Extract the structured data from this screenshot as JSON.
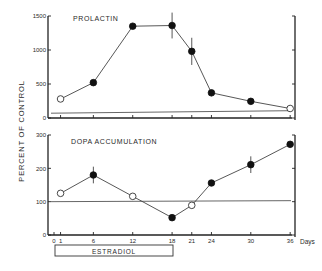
{
  "figure": {
    "y_axis_label": "PERCENT OF CONTROL",
    "x_unit_label": "Days",
    "treatment_bar_label": "ESTRADIOL",
    "treatment_period": [
      0,
      18
    ]
  },
  "chart_data": [
    {
      "type": "line",
      "title": "PROLACTIN",
      "xlabel": "Days",
      "ylabel": "PERCENT OF CONTROL",
      "x": [
        1,
        6,
        12,
        18,
        21,
        24,
        30,
        36
      ],
      "values": [
        280,
        520,
        1350,
        1360,
        980,
        370,
        245,
        140
      ],
      "marker_filled": [
        false,
        true,
        true,
        true,
        true,
        true,
        true,
        false
      ],
      "error_bars": [
        0,
        30,
        40,
        190,
        200,
        40,
        30,
        0
      ],
      "control_line": 100,
      "ylim": [
        0,
        1500
      ],
      "yticks": [
        0,
        500,
        1000,
        1500
      ],
      "ytick_labels": [
        "0",
        "500",
        "1000",
        "1500"
      ],
      "xlim": [
        0,
        36
      ],
      "xticks": [
        1,
        6,
        12,
        18,
        21,
        24,
        30,
        36
      ],
      "grid": false
    },
    {
      "type": "line",
      "title": "DOPA ACCUMULATION",
      "xlabel": "Days",
      "ylabel": "PERCENT OF CONTROL",
      "x": [
        1,
        6,
        12,
        18,
        21,
        24,
        30,
        36
      ],
      "values": [
        125,
        180,
        116,
        52,
        89,
        156,
        211,
        272
      ],
      "marker_filled": [
        false,
        true,
        false,
        true,
        false,
        true,
        true,
        true
      ],
      "error_bars": [
        0,
        25,
        0,
        0,
        0,
        0,
        25,
        0
      ],
      "control_line": 100,
      "ylim": [
        0,
        300
      ],
      "yticks": [
        0,
        100,
        200,
        300
      ],
      "ytick_labels": [
        "0",
        "100",
        "200",
        "300"
      ],
      "xlim": [
        0,
        36
      ],
      "xticks": [
        0,
        1,
        6,
        12,
        18,
        21,
        24,
        30,
        36
      ],
      "xtick_labels": [
        "0",
        "1",
        "6",
        "12",
        "18",
        "21",
        "24",
        "30",
        "36"
      ],
      "grid": false
    }
  ],
  "layout": {
    "x0_px": 54,
    "px_per_day": 6.56,
    "panels": [
      {
        "top_px": 16,
        "bottom_px": 118
      },
      {
        "top_px": 135,
        "bottom_px": 235
      }
    ],
    "left_axis_px": 48,
    "right_axis_px": 295,
    "colors": {
      "ink": "#222222",
      "background": "#ffffff"
    }
  }
}
